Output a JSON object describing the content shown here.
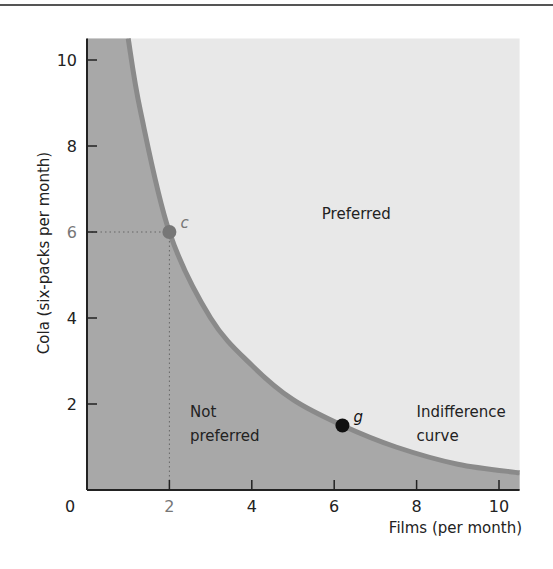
{
  "chart_data": {
    "type": "line",
    "title": "",
    "xlabel": "Films (per month)",
    "ylabel": "Cola (six-packs per month)",
    "xlim": [
      0,
      10.5
    ],
    "ylim": [
      0,
      10.5
    ],
    "x_ticks": [
      "0",
      "2",
      "4",
      "6",
      "8",
      "10"
    ],
    "y_ticks": [
      "2",
      "4",
      "6",
      "8",
      "10"
    ],
    "origin_label": "0",
    "grid": false,
    "series": [
      {
        "name": "Indifference curve",
        "points": [
          [
            1.0,
            10.5
          ],
          [
            1.3,
            8.8
          ],
          [
            2.0,
            6.0
          ],
          [
            3.0,
            4.0
          ],
          [
            4.0,
            2.9
          ],
          [
            5.0,
            2.1
          ],
          [
            6.2,
            1.5
          ],
          [
            7.5,
            1.0
          ],
          [
            9.0,
            0.6
          ],
          [
            10.5,
            0.4
          ]
        ]
      }
    ],
    "points": [
      {
        "label": "c",
        "x": 2,
        "y": 6,
        "color": "#777777"
      },
      {
        "label": "g",
        "x": 6.2,
        "y": 1.5,
        "color": "#111111"
      }
    ],
    "annotations": [
      {
        "text": "Preferred",
        "x": 5.7,
        "y": 6.3
      },
      {
        "text": "Not",
        "x": 2.5,
        "y": 1.7
      },
      {
        "text": "preferred",
        "x": 2.5,
        "y": 1.15
      },
      {
        "text": "Indifference",
        "x": 8.0,
        "y": 1.7
      },
      {
        "text": "curve",
        "x": 8.0,
        "y": 1.15
      }
    ],
    "regions": {
      "preferred_fill": "#e8e8e8",
      "not_preferred_fill": "#a8a8a8",
      "curve_color": "#8a8a8a"
    }
  }
}
